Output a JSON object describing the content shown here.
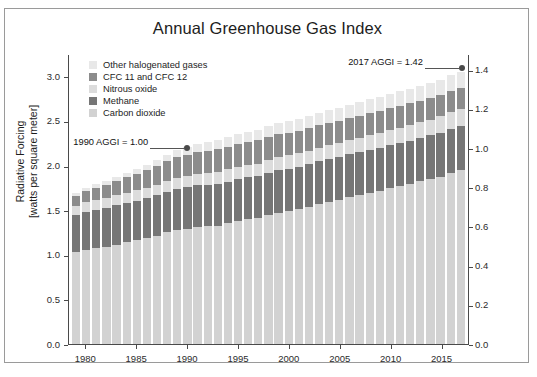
{
  "chart_data": {
    "type": "bar",
    "stacked": true,
    "title": "Annual Greenhouse Gas Index",
    "xlabel": "",
    "ylabel": "Radiative Forcing",
    "ylabel_units": "[watts per square meter]",
    "ylabel_right": "Annual Greenhouse Gas Index (AGGI)",
    "ylim": [
      0,
      3.25
    ],
    "ylim_right": [
      0,
      1.48
    ],
    "grid": false,
    "legend_position": "top-left",
    "yticks": [
      "0.0",
      "0.5",
      "1.0",
      "1.5",
      "2.0",
      "2.5",
      "3.0"
    ],
    "ytick_values": [
      0.0,
      0.5,
      1.0,
      1.5,
      2.0,
      2.5,
      3.0
    ],
    "yticks_right": [
      "0.0",
      "0.2",
      "0.4",
      "0.6",
      "0.8",
      "1.0",
      "1.2",
      "1.4"
    ],
    "ytick_right_values": [
      0.0,
      0.2,
      0.4,
      0.6,
      0.8,
      1.0,
      1.2,
      1.4
    ],
    "xticks": [
      "1980",
      "1985",
      "1990",
      "1995",
      "2000",
      "2005",
      "2010",
      "2015"
    ],
    "xtick_values": [
      1980,
      1985,
      1990,
      1995,
      2000,
      2005,
      2010,
      2015
    ],
    "x": [
      1979,
      1980,
      1981,
      1982,
      1983,
      1984,
      1985,
      1986,
      1987,
      1988,
      1989,
      1990,
      1991,
      1992,
      1993,
      1994,
      1995,
      1996,
      1997,
      1998,
      1999,
      2000,
      2001,
      2002,
      2003,
      2004,
      2005,
      2006,
      2007,
      2008,
      2009,
      2010,
      2011,
      2012,
      2013,
      2014,
      2015,
      2016,
      2017
    ],
    "series": [
      {
        "name": "Carbon dioxide",
        "color": "#d2d2d2",
        "values": [
          1.027,
          1.058,
          1.077,
          1.089,
          1.115,
          1.14,
          1.162,
          1.184,
          1.212,
          1.25,
          1.279,
          1.293,
          1.311,
          1.317,
          1.325,
          1.351,
          1.38,
          1.396,
          1.409,
          1.444,
          1.471,
          1.489,
          1.511,
          1.539,
          1.569,
          1.594,
          1.619,
          1.648,
          1.67,
          1.696,
          1.714,
          1.744,
          1.769,
          1.794,
          1.822,
          1.847,
          1.876,
          1.917,
          1.946
        ]
      },
      {
        "name": "Methane",
        "color": "#767676",
        "values": [
          0.421,
          0.426,
          0.43,
          0.434,
          0.438,
          0.442,
          0.446,
          0.45,
          0.454,
          0.458,
          0.461,
          0.464,
          0.467,
          0.468,
          0.469,
          0.47,
          0.472,
          0.473,
          0.473,
          0.476,
          0.477,
          0.477,
          0.477,
          0.477,
          0.478,
          0.478,
          0.477,
          0.477,
          0.478,
          0.48,
          0.482,
          0.483,
          0.484,
          0.486,
          0.488,
          0.49,
          0.493,
          0.496,
          0.499
        ]
      },
      {
        "name": "Nitrous oxide",
        "color": "#dcdcdc",
        "values": [
          0.104,
          0.107,
          0.109,
          0.111,
          0.113,
          0.115,
          0.117,
          0.119,
          0.121,
          0.124,
          0.126,
          0.128,
          0.13,
          0.132,
          0.133,
          0.135,
          0.137,
          0.139,
          0.141,
          0.143,
          0.145,
          0.147,
          0.149,
          0.151,
          0.153,
          0.155,
          0.157,
          0.159,
          0.161,
          0.164,
          0.166,
          0.169,
          0.171,
          0.173,
          0.176,
          0.178,
          0.181,
          0.184,
          0.187
        ]
      },
      {
        "name": "CFC 11 and CFC 12",
        "color": "#8c8c8c",
        "values": [
          0.11,
          0.122,
          0.134,
          0.146,
          0.158,
          0.17,
          0.182,
          0.194,
          0.206,
          0.218,
          0.229,
          0.238,
          0.245,
          0.25,
          0.254,
          0.256,
          0.257,
          0.258,
          0.258,
          0.258,
          0.257,
          0.257,
          0.256,
          0.255,
          0.254,
          0.253,
          0.252,
          0.251,
          0.25,
          0.248,
          0.247,
          0.246,
          0.244,
          0.243,
          0.241,
          0.24,
          0.238,
          0.237,
          0.235
        ]
      },
      {
        "name": "Other halogenated gases",
        "color": "#e8e8e8",
        "values": [
          0.032,
          0.036,
          0.04,
          0.044,
          0.048,
          0.053,
          0.058,
          0.063,
          0.068,
          0.073,
          0.079,
          0.085,
          0.091,
          0.096,
          0.101,
          0.105,
          0.109,
          0.113,
          0.117,
          0.121,
          0.125,
          0.129,
          0.132,
          0.136,
          0.139,
          0.142,
          0.145,
          0.148,
          0.151,
          0.154,
          0.157,
          0.16,
          0.163,
          0.166,
          0.169,
          0.172,
          0.175,
          0.178,
          0.181
        ]
      }
    ],
    "annotations": [
      {
        "label": "1990 AGGI = 1.00",
        "x": 1990,
        "y": 2.212
      },
      {
        "label": "2017 AGGI = 1.42",
        "x": 2017,
        "y": 3.101
      }
    ]
  },
  "legend": {
    "items": [
      {
        "label": "Other halogenated gases",
        "color": "#e8e8e8"
      },
      {
        "label": "CFC 11 and CFC 12",
        "color": "#8c8c8c"
      },
      {
        "label": "Nitrous oxide",
        "color": "#dcdcdc"
      },
      {
        "label": "Methane",
        "color": "#767676"
      },
      {
        "label": "Carbon dioxide",
        "color": "#d2d2d2"
      }
    ]
  }
}
